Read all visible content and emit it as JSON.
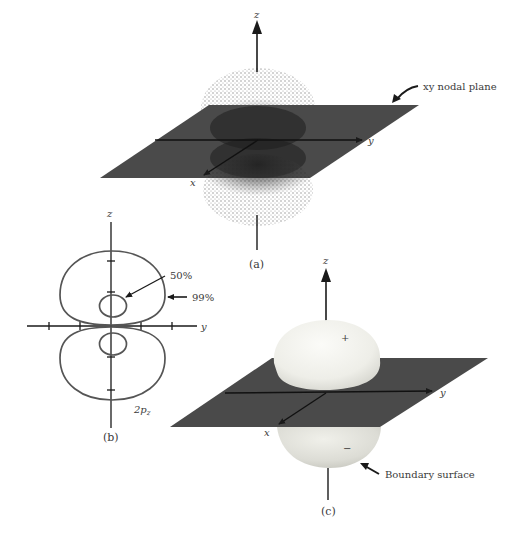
{
  "figure": {
    "panels": {
      "a": {
        "caption": "(a)",
        "axis_labels": {
          "z": "z",
          "y": "y",
          "x": "x"
        },
        "annotation": "xy nodal plane",
        "representation": "electron density dot cloud"
      },
      "b": {
        "caption": "(b)",
        "axis_labels": {
          "z": "z",
          "y": "y"
        },
        "contour_labels": {
          "inner": "50%",
          "outer": "99%"
        },
        "orbital_label_main": "2p",
        "orbital_label_sub": "z",
        "representation": "probability contours"
      },
      "c": {
        "caption": "(c)",
        "axis_labels": {
          "z": "z",
          "y": "y",
          "x": "x"
        },
        "lobe_signs": {
          "top": "+",
          "bottom": "−"
        },
        "annotation": "Boundary surface",
        "representation": "boundary surface"
      }
    },
    "colors": {
      "plane": "#4a4a4a",
      "axis": "#1a1a1a",
      "contour": "#555555",
      "lobe_light": "#f7f7f2",
      "lobe_shade": "#d8d8d2",
      "text": "#3a3a3a"
    }
  }
}
